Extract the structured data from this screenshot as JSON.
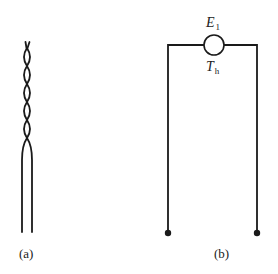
{
  "figure": {
    "panels": [
      {
        "id": "a",
        "caption": "(a)",
        "description": "twisted-pair thermocouple wires that separate into two parallel leads"
      },
      {
        "id": "b",
        "caption": "(b)",
        "description": "circuit with a junction source at the top and two open terminal leads",
        "source": {
          "emf_symbol": "E",
          "emf_subscript": "1",
          "temp_symbol": "T",
          "temp_subscript": "h"
        },
        "terminals": 2
      }
    ],
    "colors": {
      "stroke": "#1a1a1a",
      "text": "#222222",
      "background": "#ffffff"
    }
  }
}
